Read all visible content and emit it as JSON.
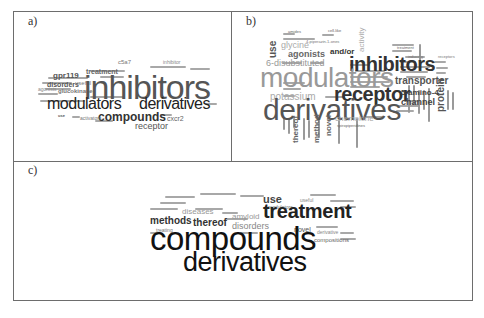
{
  "figure": {
    "panels": [
      {
        "label": "a)",
        "words": {
          "inhibitors": "inhibitors",
          "modulators": "modulators",
          "derivatives": "derivatives",
          "compounds": "compounds",
          "receptor": "receptor",
          "gpr119": "gpr119",
          "disorders": "disorders",
          "useful": "useful",
          "agonists": "agonists",
          "glucokinase": "glucokinase",
          "treatment": "treatment",
          "c5a": "c5a7",
          "activators": "activators",
          "cxcr2": "cxcr2",
          "use": "use",
          "inhibitor": "inhibitor"
        }
      },
      {
        "label": "b)",
        "words": {
          "modulators": "modulators",
          "derivatives": "derivatives",
          "inhibitors": "inhibitors",
          "receptor": "receptor",
          "use": "use",
          "glycine": "glycine",
          "agonists": "agonists",
          "and_or": "and/or",
          "disubstituted": "6-disubstituted",
          "activity": "activity",
          "transporter": "transporter",
          "potassium": "potassium",
          "amino": "5-amino-4",
          "channel": "channel",
          "protein": "protein",
          "chemokine": "chemokine",
          "thereof": "thereof",
          "method": "method",
          "novel": "novel",
          "treatment": "treatment",
          "receptors": "receptors",
          "inducing": "inducing",
          "piperazin": "4-piperazin-1-ones",
          "amides": "amides",
          "cell_like": "cell-like",
          "useful": "useful",
          "spiropiperidines": "spiropiperidines"
        }
      },
      {
        "label": "c)",
        "words": {
          "compounds": "compounds",
          "derivatives": "derivatives",
          "treatment": "treatment",
          "use": "use",
          "methods": "methods",
          "thereof": "thereof",
          "disorders": "disorders",
          "diseases": "diseases",
          "amyloid": "amyloid",
          "novel": "novel",
          "derivative": "derivative",
          "compositions": "compositions",
          "modulators": "modulators",
          "treating": "treating",
          "useful": "useful"
        }
      }
    ]
  }
}
